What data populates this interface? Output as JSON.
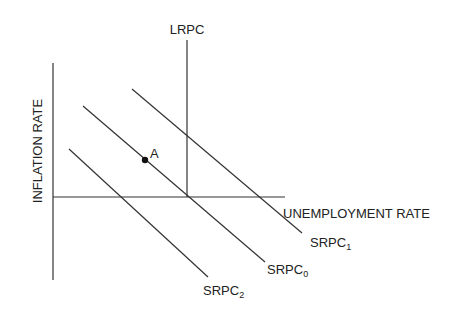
{
  "diagram": {
    "axes": {
      "y_label": "INFLATION RATE",
      "x_label": "UNEMPLOYMENT RATE"
    },
    "curves": {
      "lrpc": {
        "label": "LRPC"
      },
      "srpc0": {
        "base": "SRPC",
        "subscript": "0"
      },
      "srpc1": {
        "base": "SRPC",
        "subscript": "1"
      },
      "srpc2": {
        "base": "SRPC",
        "subscript": "2"
      }
    },
    "points": {
      "a": {
        "label": "A"
      }
    },
    "colors": {
      "line": "#333333",
      "text": "#222222",
      "background": "#ffffff"
    }
  }
}
